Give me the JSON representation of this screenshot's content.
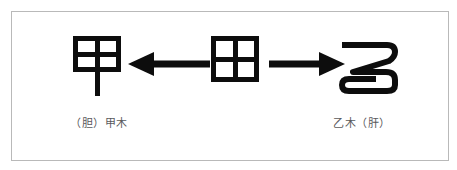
{
  "figure": {
    "type": "relationship-diagram",
    "background_color": "#ffffff",
    "frame_border_color": "#b9b9b9",
    "ink_color": "#0d0d0d",
    "caption_color": "#59595c",
    "nodes": [
      {
        "id": "node-left",
        "glyph": "甲",
        "glyph_style": "seal-script",
        "caption": "（胆）甲木"
      },
      {
        "id": "node-center",
        "glyph": "田",
        "glyph_style": "seal-script",
        "caption": ""
      },
      {
        "id": "node-right",
        "glyph": "乙",
        "glyph_style": "seal-script",
        "caption": "乙木（肝）"
      }
    ],
    "arrows": [
      {
        "id": "arrow-left",
        "direction": "left",
        "from": "node-center",
        "to": "node-left"
      },
      {
        "id": "arrow-right",
        "direction": "right",
        "from": "node-center",
        "to": "node-right"
      }
    ]
  }
}
